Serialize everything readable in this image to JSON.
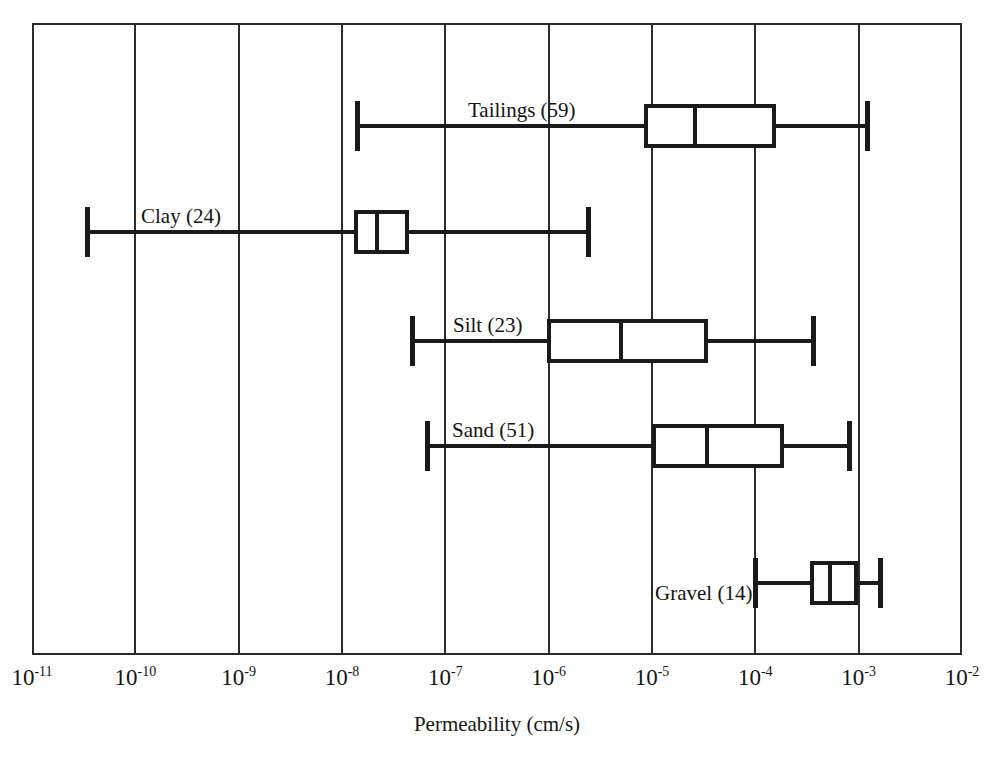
{
  "chart_data": {
    "type": "box",
    "title": "",
    "xlabel": "Permeability (cm/s)",
    "ylabel": "",
    "xscale": "log",
    "xlim": [
      1e-11,
      0.01
    ],
    "grid": true,
    "legend": "none",
    "xticks": [
      {
        "value": 1e-11,
        "mantissa": "10",
        "exponent": "-11",
        "label": "10-11"
      },
      {
        "value": 1e-10,
        "mantissa": "10",
        "exponent": "-10",
        "label": "10-10"
      },
      {
        "value": 1e-09,
        "mantissa": "10",
        "exponent": "-9",
        "label": "10-9"
      },
      {
        "value": 1e-08,
        "mantissa": "10",
        "exponent": "-8",
        "label": "10-8"
      },
      {
        "value": 1e-07,
        "mantissa": "10",
        "exponent": "-7",
        "label": "10-7"
      },
      {
        "value": 1e-06,
        "mantissa": "10",
        "exponent": "-6",
        "label": "10-6"
      },
      {
        "value": 1e-05,
        "mantissa": "10",
        "exponent": "-5",
        "label": "10-5"
      },
      {
        "value": 0.0001,
        "mantissa": "10",
        "exponent": "-4",
        "label": "10-4"
      },
      {
        "value": 0.001,
        "mantissa": "10",
        "exponent": "-3",
        "label": "10-3"
      },
      {
        "value": 0.01,
        "mantissa": "10",
        "exponent": "-2",
        "label": "10-2"
      }
    ],
    "categories": [
      "Tailings",
      "Clay",
      "Silt",
      "Sand",
      "Gravel"
    ],
    "boxes": [
      {
        "category": "Tailings",
        "count": 59,
        "label": "Tailings (59)",
        "min": 1.4e-08,
        "q1": 8.3e-06,
        "median": 2.6e-05,
        "q3": 0.00016,
        "max": 0.0012,
        "label_x_px": 468,
        "row_center_px": 126
      },
      {
        "category": "Clay",
        "count": 24,
        "label": "Clay (24)",
        "min": 3.4e-11,
        "q1": 1.3e-08,
        "median": 2.2e-08,
        "q3": 4.5e-08,
        "max": 2.4e-06,
        "label_x_px": 141,
        "row_center_px": 232
      },
      {
        "category": "Silt",
        "count": 23,
        "label": "Silt (23)",
        "min": 4.8e-08,
        "q1": 9.6e-07,
        "median": 5e-06,
        "q3": 3.5e-05,
        "max": 0.00036,
        "label_x_px": 453,
        "row_center_px": 341
      },
      {
        "category": "Sand",
        "count": 51,
        "label": "Sand (51)",
        "min": 6.6e-08,
        "q1": 1e-05,
        "median": 3.4e-05,
        "q3": 0.00019,
        "max": 0.0008,
        "label_x_px": 452,
        "row_center_px": 446
      },
      {
        "category": "Gravel",
        "count": 14,
        "label": "Gravel (14)",
        "min": 0.0001,
        "q1": 0.00034,
        "median": 0.00053,
        "q3": 0.00098,
        "max": 0.0016,
        "label_x_px": 655,
        "row_center_px": 583
      }
    ]
  },
  "geometry": {
    "plot_left_px": 32,
    "plot_top_px": 23,
    "plot_right_px": 962,
    "plot_bottom_px": 655,
    "px_per_decade": 103.33,
    "decade_min": -11,
    "box_half_height_px": 22,
    "cap_half_height_px": 25,
    "tick_label_y_px": 666,
    "axis_title_x_px": 497,
    "axis_title_y_px": 714
  },
  "colors": {
    "frame": "#2b2b2b",
    "gridline": "#2b2b2b",
    "box_stroke": "#1a1a1a",
    "box_fill": "#ffffff",
    "text": "#141414",
    "background": "#ffffff"
  }
}
